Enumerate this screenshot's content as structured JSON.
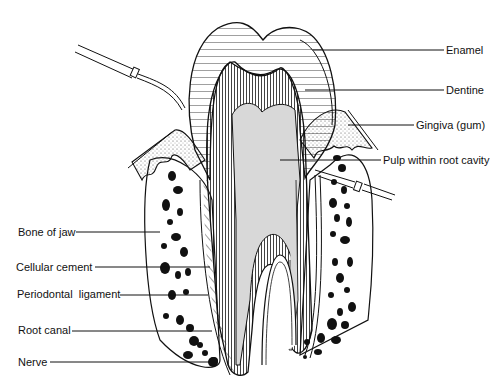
{
  "diagram": {
    "labels_right": [
      {
        "text": "Enamel",
        "x": 446,
        "y": 44
      },
      {
        "text": "Dentine",
        "x": 446,
        "y": 84
      },
      {
        "text": "Gingiva (gum)",
        "x": 416,
        "y": 119
      },
      {
        "text": "Pulp within root cavity",
        "x": 383,
        "y": 154
      }
    ],
    "labels_left": [
      {
        "text": "Bone of jaw",
        "x": 18,
        "y": 226
      },
      {
        "text": "Cellular cement",
        "x": 16,
        "y": 261
      },
      {
        "text": "Periodontal  ligament",
        "x": 17,
        "y": 288
      },
      {
        "text": "Root canal",
        "x": 18,
        "y": 324
      },
      {
        "text": "Nerve",
        "x": 18,
        "y": 356
      }
    ],
    "colors": {
      "line": "#111111",
      "pulp": "#d8d8d8",
      "background": "#ffffff"
    }
  }
}
